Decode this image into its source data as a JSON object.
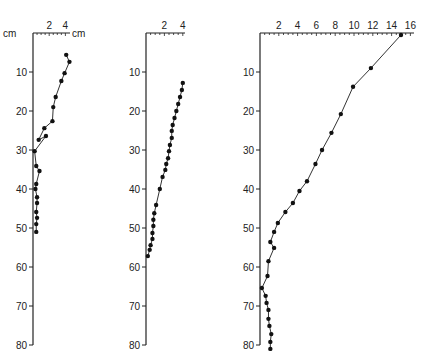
{
  "chart_data": [
    {
      "type": "line",
      "panel": "left",
      "title": "",
      "xlabel": "cm",
      "ylabel": "cm",
      "x_ticks": [
        "2",
        "4"
      ],
      "y_ticks": [
        "10",
        "20",
        "30",
        "40",
        "50",
        "60",
        "70",
        "80"
      ],
      "xlim": [
        0,
        4
      ],
      "ylim": [
        80,
        0
      ],
      "points": [
        [
          4.1,
          5.6
        ],
        [
          4.5,
          7.4
        ],
        [
          3.9,
          10.3
        ],
        [
          3.5,
          12.3
        ],
        [
          2.8,
          16.4
        ],
        [
          2.5,
          19
        ],
        [
          2.4,
          22.6
        ],
        [
          1.4,
          24.4
        ],
        [
          0.7,
          27.4
        ],
        [
          1.6,
          26.4
        ],
        [
          0.2,
          30.3
        ],
        [
          0.4,
          34.1
        ],
        [
          0.8,
          35.4
        ],
        [
          0.4,
          38.7
        ],
        [
          0.3,
          40
        ],
        [
          0.5,
          42.1
        ],
        [
          0.5,
          43.6
        ],
        [
          0.4,
          45.9
        ],
        [
          0.5,
          47.4
        ],
        [
          0.4,
          49
        ],
        [
          0.4,
          51
        ]
      ]
    },
    {
      "type": "line",
      "panel": "middle",
      "xlabel": "",
      "ylabel": "",
      "x_ticks": [
        "2",
        "4"
      ],
      "y_ticks": [
        "10",
        "20",
        "30",
        "40",
        "50",
        "60",
        "70",
        "80"
      ],
      "xlim": [
        0,
        4
      ],
      "ylim": [
        80,
        0
      ],
      "points": [
        [
          4.0,
          12.8
        ],
        [
          3.9,
          14.6
        ],
        [
          3.7,
          16.4
        ],
        [
          3.5,
          18.2
        ],
        [
          3.3,
          20
        ],
        [
          3.1,
          21.8
        ],
        [
          2.9,
          23.6
        ],
        [
          2.8,
          25.1
        ],
        [
          2.8,
          26.9
        ],
        [
          2.6,
          28.7
        ],
        [
          2.5,
          30.3
        ],
        [
          2.4,
          32.1
        ],
        [
          2.2,
          33.6
        ],
        [
          2.1,
          35.1
        ],
        [
          1.8,
          36.9
        ],
        [
          1.5,
          40
        ],
        [
          1.1,
          44.1
        ],
        [
          0.9,
          46.2
        ],
        [
          0.8,
          47.9
        ],
        [
          0.8,
          49.5
        ],
        [
          0.7,
          51.3
        ],
        [
          0.7,
          52.8
        ],
        [
          0.5,
          54.4
        ],
        [
          0.4,
          55.6
        ],
        [
          0.2,
          57.2
        ]
      ]
    },
    {
      "type": "line",
      "panel": "right",
      "xlabel": "",
      "ylabel": "",
      "x_ticks": [
        "2",
        "4",
        "6",
        "8",
        "10",
        "12",
        "14",
        "16"
      ],
      "y_ticks": [
        "10",
        "20",
        "30",
        "40",
        "50",
        "60",
        "70",
        "80"
      ],
      "xlim": [
        0,
        16
      ],
      "ylim": [
        80,
        0
      ],
      "points": [
        [
          15.0,
          0.5
        ],
        [
          11.8,
          9
        ],
        [
          9.9,
          13.8
        ],
        [
          8.6,
          20.8
        ],
        [
          7.6,
          25.6
        ],
        [
          6.6,
          30
        ],
        [
          5.9,
          33.6
        ],
        [
          5.0,
          38
        ],
        [
          4.2,
          40.5
        ],
        [
          3.5,
          43.6
        ],
        [
          2.7,
          45.9
        ],
        [
          1.9,
          48.7
        ],
        [
          1.5,
          51
        ],
        [
          1.1,
          53.6
        ],
        [
          1.5,
          55.1
        ],
        [
          0.9,
          58.5
        ],
        [
          0.8,
          62.3
        ],
        [
          0.2,
          65.4
        ],
        [
          0.6,
          67.4
        ],
        [
          0.7,
          69.2
        ],
        [
          0.9,
          71
        ],
        [
          0.9,
          73.3
        ],
        [
          1.0,
          75.1
        ],
        [
          1.2,
          77.2
        ],
        [
          1.1,
          79.2
        ],
        [
          1.1,
          81
        ]
      ]
    }
  ],
  "labels": {
    "left_y_unit": "cm",
    "left_x_unit": "cm",
    "y_tick_labels": [
      "10",
      "20",
      "30",
      "40",
      "50",
      "60",
      "70",
      "80"
    ],
    "left_x_tick_labels": [
      "2",
      "4"
    ],
    "middle_x_tick_labels": [
      "2",
      "4"
    ],
    "right_x_tick_labels": [
      "2",
      "4",
      "6",
      "8",
      "10",
      "12",
      "14",
      "16"
    ]
  }
}
